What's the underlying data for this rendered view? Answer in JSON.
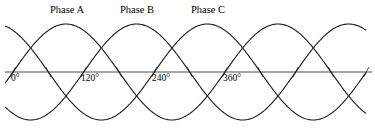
{
  "figure": {
    "title": "",
    "background_color": "#ffffff",
    "width": 375,
    "height": 132
  },
  "phase_labels": [
    {
      "text": "Phase A",
      "x": 50,
      "y": 5
    },
    {
      "text": "Phase B",
      "x": 120,
      "y": 5
    },
    {
      "text": "Phase C",
      "x": 191,
      "y": 5
    }
  ],
  "axis_labels": [
    {
      "text": "0°",
      "x": 11,
      "y": 74
    },
    {
      "text": "120°",
      "x": 81,
      "y": 74
    },
    {
      "text": "240°",
      "x": 152,
      "y": 74
    },
    {
      "text": "360°",
      "x": 223,
      "y": 74
    }
  ],
  "chart_data": {
    "type": "line",
    "title": "",
    "subtitle": "",
    "xlabel": "",
    "ylabel": "",
    "grid": false,
    "legend_position": "above-curves",
    "x_axis": {
      "tick_labels": [
        "0°",
        "120°",
        "240°",
        "360°"
      ],
      "tick_values": [
        0,
        120,
        240,
        360
      ],
      "range_degrees": [
        -22,
        600
      ],
      "pixel_origin_x": 13,
      "pixel_per_360_deg": 212,
      "axis_pixel_y": 72,
      "axis_pixel_x_start": 5,
      "axis_pixel_x_end": 372
    },
    "y_axis": {
      "amplitude": 1.0,
      "amplitude_pixels": 48,
      "ylim": [
        -1.0,
        1.0
      ],
      "tick_labels": []
    },
    "series": [
      {
        "name": "Phase A",
        "color": "#1a1a1a",
        "phase_offset_degrees": 0,
        "amplitude": 1.0,
        "equation": "sin(x)",
        "x": [
          0,
          30,
          60,
          90,
          120,
          150,
          180,
          210,
          240,
          270,
          300,
          330,
          360,
          390,
          420,
          450,
          480,
          510,
          540,
          570,
          600
        ],
        "values": [
          0,
          0.5,
          0.866,
          1,
          0.866,
          0.5,
          0,
          -0.5,
          -0.866,
          -1,
          -0.866,
          -0.5,
          0,
          0.5,
          0.866,
          1,
          0.866,
          0.5,
          0,
          -0.5,
          -0.866
        ]
      },
      {
        "name": "Phase B",
        "color": "#1a1a1a",
        "phase_offset_degrees": -120,
        "amplitude": 1.0,
        "equation": "sin(x - 120°)",
        "x": [
          0,
          30,
          60,
          90,
          120,
          150,
          180,
          210,
          240,
          270,
          300,
          330,
          360,
          390,
          420,
          450,
          480,
          510,
          540,
          570,
          600
        ],
        "values": [
          -0.866,
          -0.5,
          0,
          0.5,
          0.866,
          1,
          0.866,
          0.5,
          0,
          -0.5,
          -0.866,
          -1,
          -0.866,
          -0.5,
          0,
          0.5,
          0.866,
          1,
          0.866,
          0.5,
          0
        ]
      },
      {
        "name": "Phase C",
        "color": "#1a1a1a",
        "phase_offset_degrees": -240,
        "amplitude": 1.0,
        "equation": "sin(x - 240°)",
        "x": [
          0,
          30,
          60,
          90,
          120,
          150,
          180,
          210,
          240,
          270,
          300,
          330,
          360,
          390,
          420,
          450,
          480,
          510,
          540,
          570,
          600
        ],
        "values": [
          0.866,
          1,
          0.866,
          0.5,
          0,
          -0.5,
          -0.866,
          -1,
          -0.866,
          -0.5,
          0,
          0.5,
          0.866,
          1,
          0.866,
          0.5,
          0,
          -0.5,
          -0.866,
          -1,
          -0.866
        ]
      }
    ],
    "annotations": [
      {
        "text": "Phase A",
        "target_series": "Phase A",
        "position": "above-first-peak"
      },
      {
        "text": "Phase B",
        "target_series": "Phase B",
        "position": "above-first-peak"
      },
      {
        "text": "Phase C",
        "target_series": "Phase C",
        "position": "above-first-peak"
      }
    ]
  },
  "style": {
    "curve_color": "#1a1a1a",
    "curve_width": 1.1,
    "axis_color": "#3a3a3a",
    "axis_width": 0.9,
    "tick_color": "#3a3a3a",
    "text_color": "#000000"
  }
}
